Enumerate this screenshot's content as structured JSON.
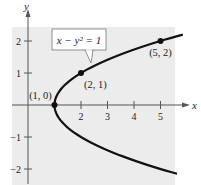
{
  "chart_data": {
    "type": "line",
    "title": "",
    "equation_label": "x − y² = 1",
    "xlabel": "x",
    "ylabel": "y",
    "xlim": [
      -0.6,
      5.6
    ],
    "ylim": [
      -2.4,
      2.5
    ],
    "x_ticks": [
      2,
      3,
      4,
      5
    ],
    "x_tick_labels": [
      "2",
      "3",
      "4",
      "5"
    ],
    "y_ticks": [
      2,
      1,
      -1,
      -2
    ],
    "y_tick_labels": [
      "2",
      "1",
      "−1",
      "−2"
    ],
    "grid": false,
    "series": [
      {
        "name": "x − y² = 1",
        "relation": "x = 1 + y^2",
        "y_range": [
          -2.15,
          2.2
        ]
      }
    ],
    "points": [
      {
        "x": 1,
        "y": 0,
        "label": "(1, 0)"
      },
      {
        "x": 2,
        "y": 1,
        "label": "(2, 1)"
      },
      {
        "x": 5,
        "y": 2,
        "label": "(5, 2)"
      }
    ],
    "colors": {
      "plot_background": "#ececec",
      "curve": "#111111",
      "axes": "#555555"
    }
  }
}
